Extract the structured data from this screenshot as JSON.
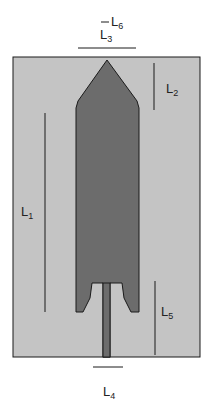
{
  "diagram": {
    "type": "antenna-geometry",
    "colors": {
      "background": "#ffffff",
      "substrate": "#c4c4c4",
      "patch": "#6c6c6c",
      "outline": "#1a1a1a",
      "dimension_line": "#1a1a1a"
    },
    "labels": {
      "L1": {
        "main": "L",
        "sub": "1"
      },
      "L2": {
        "main": "L",
        "sub": "2"
      },
      "L3": {
        "main": "L",
        "sub": "3"
      },
      "L4": {
        "main": "L",
        "sub": "4"
      },
      "L5": {
        "main": "L",
        "sub": "5"
      },
      "L6": {
        "main": "L",
        "sub": "6"
      }
    }
  }
}
